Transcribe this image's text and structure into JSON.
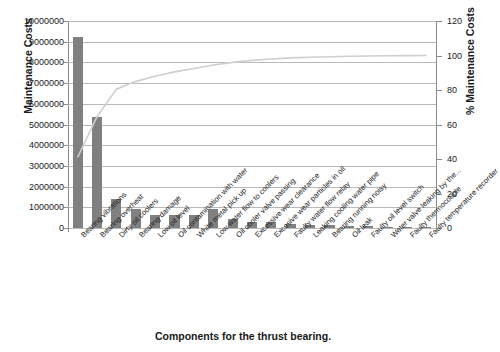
{
  "chart_data": {
    "type": "bar",
    "title": "",
    "xlabel": "Components for the thrust bearing.",
    "ylabel": "Maintenance Costs",
    "y2label": "% Maintenance Costs",
    "ylim": [
      0,
      10000000
    ],
    "y2lim": [
      0,
      120
    ],
    "ytick_labels": [
      "10000000",
      "9000000",
      "8000000",
      "7000000",
      "6000000",
      "5000000",
      "4000000",
      "3000000",
      "2000000",
      "1000000",
      "0"
    ],
    "ytick_values": [
      10000000,
      9000000,
      8000000,
      7000000,
      6000000,
      5000000,
      4000000,
      3000000,
      2000000,
      1000000,
      0
    ],
    "y2tick_labels": [
      "120",
      "100",
      "80",
      "60",
      "40",
      "20",
      "0"
    ],
    "y2tick_values": [
      120,
      100,
      80,
      60,
      40,
      20,
      0
    ],
    "grid": true,
    "legend": "none",
    "bar_color": "#808080",
    "line_color": "#cfcfcf",
    "categories": [
      "Bearing vibrations",
      "Bearing overheat",
      "Dirty oil coolers",
      "Bearing damage",
      "Low oil level",
      "Oil contamination with water",
      "White metal pick up",
      "Low water flow to coolers",
      "Oil cooler valve passing",
      "Excessive wear clearance",
      "Excesive wear particles in oil",
      "Faulty water flow relay",
      "Leaking cooling water pipe",
      "Bearing running noisy",
      "Oil leak",
      "Faulty oil level switch",
      "Water valve leaking by the...",
      "Faulty thermocouple",
      "Faulty temperature recorder"
    ],
    "values": [
      9250000,
      5350000,
      1400000,
      900000,
      650000,
      650000,
      650000,
      900000,
      450000,
      300000,
      300000,
      200000,
      150000,
      150000,
      100000,
      80000,
      60000,
      40000,
      20000
    ],
    "series": [
      {
        "name": "Maintenance Costs",
        "type": "bar",
        "values": [
          9250000,
          5350000,
          1400000,
          900000,
          650000,
          650000,
          650000,
          900000,
          450000,
          300000,
          300000,
          200000,
          150000,
          150000,
          100000,
          80000,
          60000,
          40000,
          20000
        ]
      },
      {
        "name": "% Maintenance Costs",
        "type": "line",
        "axis": "secondary",
        "values": [
          41.0,
          64.5,
          80.5,
          85.0,
          88.0,
          90.5,
          92.5,
          94.5,
          96.0,
          97.2,
          98.0,
          98.6,
          99.0,
          99.3,
          99.55,
          99.7,
          99.85,
          99.95,
          100.0
        ]
      }
    ]
  }
}
